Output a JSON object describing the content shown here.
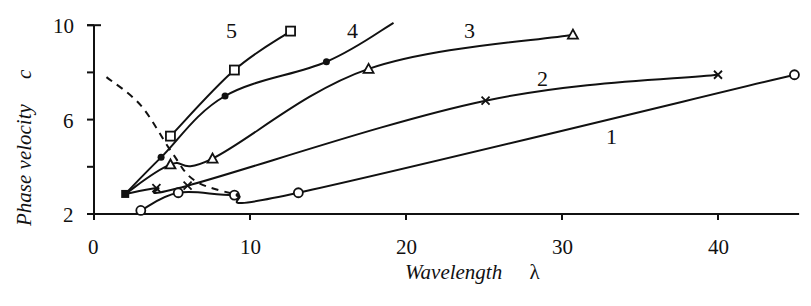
{
  "chart_data": {
    "type": "line",
    "title": "",
    "xlabel": "Wavelength",
    "xlabel_symbol": "λ",
    "ylabel": "Phase velocity",
    "ylabel_symbol": "c",
    "xlim": [
      0,
      45
    ],
    "ylim": [
      2,
      10
    ],
    "x_ticks": [
      0,
      10,
      20,
      30,
      40
    ],
    "x_tick_labels": [
      "0",
      "10",
      "20",
      "30",
      "40"
    ],
    "y_ticks": [
      2,
      4,
      6,
      8,
      10
    ],
    "y_tick_labels": [
      "2",
      "",
      "6",
      "",
      "10"
    ],
    "grid": false,
    "legend": "inline numeric labels next to curves",
    "series": [
      {
        "name": "1",
        "marker": "circle-open",
        "x": [
          3.0,
          5.4,
          9.0,
          13.1,
          44.9
        ],
        "values": [
          2.15,
          2.9,
          2.8,
          2.9,
          7.9
        ],
        "label_pos": [
          33.0,
          5.6
        ]
      },
      {
        "name": "2",
        "marker": "cross",
        "x": [
          2.0,
          4.0,
          6.0,
          25.1,
          40.0
        ],
        "values": [
          2.85,
          3.1,
          3.2,
          6.8,
          7.9
        ],
        "label_pos": [
          28.8,
          7.4
        ]
      },
      {
        "name": "3",
        "marker": "triangle-open",
        "x": [
          2.0,
          4.9,
          7.6,
          17.6,
          30.7
        ],
        "values": [
          2.85,
          4.1,
          4.35,
          8.15,
          9.6
        ],
        "label_pos": [
          24.1,
          9.3
        ]
      },
      {
        "name": "4",
        "marker": "dot-filled",
        "x": [
          2.0,
          4.3,
          8.4,
          14.9,
          19.2
        ],
        "values": [
          2.85,
          4.4,
          7.0,
          8.45,
          10.1
        ],
        "label_pos": [
          16.6,
          9.3
        ]
      },
      {
        "name": "5",
        "marker": "square-open",
        "x": [
          4.9,
          9.0,
          12.6
        ],
        "values": [
          5.3,
          8.1,
          9.75
        ],
        "label_pos": [
          9.0,
          9.7
        ]
      },
      {
        "name": "dashed",
        "marker": "none",
        "style": "dashed",
        "x": [
          0.8,
          3.0,
          5.0,
          6.5,
          9.2
        ],
        "values": [
          7.8,
          6.6,
          4.6,
          3.4,
          2.8
        ]
      }
    ]
  },
  "labels": {
    "x_axis_title": "Wavelength",
    "x_axis_symbol": "λ",
    "y_axis_title": "Phase velocity",
    "y_axis_symbol": "c",
    "x_ticks": [
      "0",
      "10",
      "20",
      "30",
      "40"
    ],
    "y_ticks": [
      "2",
      "6",
      "10"
    ],
    "series_labels": [
      "1",
      "2",
      "3",
      "4",
      "5"
    ]
  }
}
